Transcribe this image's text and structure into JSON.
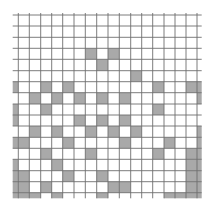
{
  "grid": {
    "col_edges": [
      12.7,
      18.3,
      29.3,
      40.7,
      51.7,
      62.7,
      74,
      85.3,
      96.7,
      108,
      119.3,
      130.7,
      141.7,
      152.7,
      164,
      175,
      186,
      197,
      201.7
    ],
    "row_edges": [
      15,
      26,
      37.3,
      48.3,
      59.3,
      70.7,
      81.7,
      92.7,
      104,
      115,
      126,
      137.3,
      148.3,
      159.3,
      170.7,
      181.7,
      192.7,
      198.3
    ],
    "line_color": "#6e6e6e",
    "fill_color": "#a9a9a9",
    "background": "#ffffff",
    "shaded_cells": [
      [
        3,
        7
      ],
      [
        3,
        9
      ],
      [
        4,
        8
      ],
      [
        5,
        11
      ],
      [
        6,
        0
      ],
      [
        6,
        3
      ],
      [
        6,
        5
      ],
      [
        6,
        13
      ],
      [
        6,
        16
      ],
      [
        6,
        17
      ],
      [
        7,
        2
      ],
      [
        7,
        4
      ],
      [
        7,
        6
      ],
      [
        7,
        8
      ],
      [
        7,
        10
      ],
      [
        7,
        17
      ],
      [
        8,
        0
      ],
      [
        8,
        3
      ],
      [
        8,
        13
      ],
      [
        9,
        0
      ],
      [
        9,
        6
      ],
      [
        9,
        8
      ],
      [
        9,
        10
      ],
      [
        10,
        2
      ],
      [
        10,
        4
      ],
      [
        10,
        7
      ],
      [
        10,
        9
      ],
      [
        10,
        11
      ],
      [
        10,
        17
      ],
      [
        11,
        0
      ],
      [
        11,
        1
      ],
      [
        11,
        5
      ],
      [
        11,
        10
      ],
      [
        11,
        14
      ],
      [
        11,
        17
      ],
      [
        12,
        3
      ],
      [
        12,
        7
      ],
      [
        12,
        13
      ],
      [
        12,
        16
      ],
      [
        12,
        17
      ],
      [
        13,
        0
      ],
      [
        13,
        4
      ],
      [
        13,
        16
      ],
      [
        13,
        17
      ],
      [
        14,
        0
      ],
      [
        14,
        1
      ],
      [
        14,
        5
      ],
      [
        14,
        8
      ],
      [
        14,
        16
      ],
      [
        14,
        17
      ],
      [
        15,
        0
      ],
      [
        15,
        1
      ],
      [
        15,
        3
      ],
      [
        15,
        9
      ],
      [
        15,
        10
      ],
      [
        15,
        16
      ],
      [
        15,
        17
      ],
      [
        16,
        0
      ],
      [
        16,
        1
      ],
      [
        16,
        2
      ],
      [
        16,
        4
      ],
      [
        16,
        8
      ],
      [
        16,
        14
      ],
      [
        16,
        15
      ],
      [
        16,
        16
      ],
      [
        16,
        17
      ]
    ]
  }
}
